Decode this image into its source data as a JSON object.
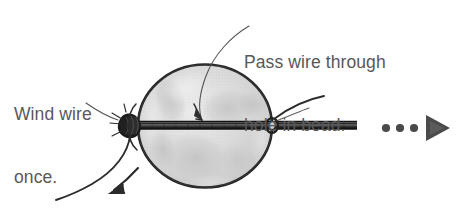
{
  "diagram": {
    "title": "Pass wire through hole in bead",
    "background_color": "#ffffff",
    "width": 462,
    "height": 216,
    "annotations": [
      {
        "id": "wind-wire",
        "text": "Wind wire\nonce.",
        "line1": "Wind wire",
        "line2": "once.",
        "color": "#58585a",
        "x": 14,
        "y": 62,
        "leader": "curve-from-text-to-left-knot"
      },
      {
        "id": "pass-wire",
        "text": "Pass wire through\nhole in bead.",
        "line1": "Pass wire through",
        "line2": "hole in bead.",
        "color": "#58585a",
        "x": 244,
        "y": 10,
        "leader": "curve-from-text-down-into-bead"
      }
    ],
    "shapes": {
      "bead": {
        "name": "bead-sphere",
        "cx": 205,
        "cy": 126,
        "rx": 68,
        "ry": 62,
        "outline_color": "#2b2b2b",
        "fill_color": "#d8d8d8"
      },
      "wire": {
        "name": "wire-through-bead",
        "x_start": 122,
        "x_end": 357,
        "y": 125,
        "color": "#2a2a2a",
        "thickness": 7
      },
      "left_knot": {
        "name": "wire-coil-knot-left",
        "cx": 130,
        "cy": 125,
        "color": "#1e1e1e"
      },
      "right_knot": {
        "name": "wire-loop-right",
        "cx": 272,
        "cy": 125,
        "color": "#1e1e1e"
      },
      "tail_arrow": {
        "name": "wire-tail-arrow-down-left",
        "color": "#2b2b2b",
        "direction": "down-left",
        "tip_x": 112,
        "tip_y": 190
      },
      "upper_tail": {
        "name": "wire-tail-upper-right",
        "color": "#2b2b2b",
        "direction": "up-right"
      }
    },
    "step_indicator": {
      "name": "next-step-indicator",
      "dots": 3,
      "dot_color": "#4a4a4a",
      "dot_positions": [
        386,
        400,
        414
      ],
      "dot_y": 128,
      "triangle": {
        "name": "play-triangle-icon",
        "color": "#4a4a4a",
        "x": 425,
        "y": 128,
        "direction": "right"
      }
    }
  }
}
